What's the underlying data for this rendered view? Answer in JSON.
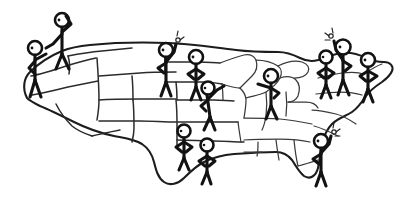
{
  "artwork": {
    "title": "Hand-drawn United States map with stick figures",
    "style": "doodle-sketch",
    "background_color": "#ffffff",
    "ink_color": "#121212",
    "state_line_color": "#2b2b2b",
    "outline_color": "#1c1c1c",
    "canvas": {
      "width": 405,
      "height": 207
    }
  },
  "map": {
    "name": "united-states-map",
    "label": "United States",
    "region_count": 48
  },
  "figures": [
    {
      "id": "figure-pacific-northwest",
      "label": "Stick figure on Pacific Northwest",
      "pose": "standing, hand on hip, arm reaching right",
      "has_raised_arm": false,
      "has_spark": false,
      "x": 36,
      "y": 43
    },
    {
      "id": "figure-northern-rockies",
      "label": "Stick figure on northern Rockies",
      "pose": "standing, hand shading eyes, looking out",
      "has_raised_arm": true,
      "has_spark": false,
      "x": 63,
      "y": 18
    },
    {
      "id": "figure-northern-plains-west",
      "label": "Stick figure on northern plains west",
      "pose": "standing, arm raised waving",
      "has_raised_arm": true,
      "has_spark": true,
      "x": 167,
      "y": 45
    },
    {
      "id": "figure-northern-plains-east",
      "label": "Stick figure on northern plains east",
      "pose": "standing, hands on hips",
      "has_raised_arm": false,
      "has_spark": false,
      "x": 196,
      "y": 52
    },
    {
      "id": "figure-upper-midwest",
      "label": "Stick figure on upper midwest",
      "pose": "leaning forward, arm extended",
      "has_raised_arm": false,
      "has_spark": false,
      "x": 210,
      "y": 85
    },
    {
      "id": "figure-great-lakes",
      "label": "Stick figure on great lakes",
      "pose": "standing, arm pointing left",
      "has_raised_arm": false,
      "has_spark": false,
      "x": 271,
      "y": 72
    },
    {
      "id": "figure-northeast-left",
      "label": "Stick figure on northeast left",
      "pose": "standing, hands on hips",
      "has_raised_arm": false,
      "has_spark": false,
      "x": 327,
      "y": 52
    },
    {
      "id": "figure-northeast-center",
      "label": "Stick figure on northeast center",
      "pose": "standing, arm raised waving",
      "has_raised_arm": true,
      "has_spark": true,
      "x": 343,
      "y": 42
    },
    {
      "id": "figure-northeast-right",
      "label": "Stick figure on northeast right",
      "pose": "standing, hands on hips",
      "has_raised_arm": false,
      "has_spark": false,
      "x": 368,
      "y": 55
    },
    {
      "id": "figure-southern-plains-left",
      "label": "Stick figure on southern plains left",
      "pose": "standing, hands on hips",
      "has_raised_arm": false,
      "has_spark": false,
      "x": 184,
      "y": 126
    },
    {
      "id": "figure-southern-plains-right",
      "label": "Stick figure on southern plains right",
      "pose": "standing, hands on hips",
      "has_raised_arm": false,
      "has_spark": false,
      "x": 207,
      "y": 140
    },
    {
      "id": "figure-southeast",
      "label": "Stick figure on southeast",
      "pose": "standing, arm raised waving",
      "has_raised_arm": true,
      "has_spark": true,
      "x": 322,
      "y": 136
    }
  ]
}
